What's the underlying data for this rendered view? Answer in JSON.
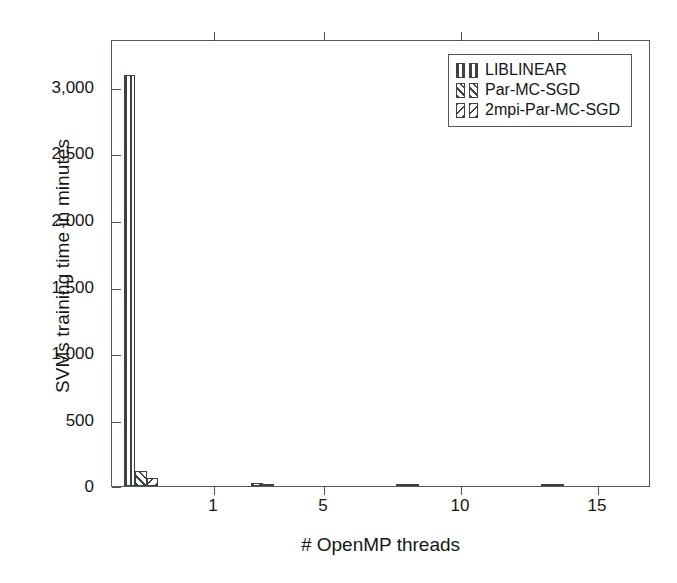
{
  "chart_data": {
    "type": "bar",
    "title": "",
    "xlabel": "# OpenMP threads",
    "ylabel": "SVMs training time in minutes",
    "categories": [
      "1",
      "5",
      "10",
      "15"
    ],
    "x": [
      1,
      5,
      10,
      15
    ],
    "xlim": [
      0,
      18.5
    ],
    "ylim": [
      0,
      3350
    ],
    "yticks": [
      0,
      500,
      1000,
      1500,
      2000,
      2500,
      3000
    ],
    "ytick_labels": [
      "0",
      "500",
      "1,000",
      "1,500",
      "2,000",
      "2,500",
      "3,000"
    ],
    "xticks": [
      1,
      5,
      10,
      15
    ],
    "xtick_labels": [
      "1",
      "5",
      "10",
      "15"
    ],
    "grid": false,
    "legend_position": "top-right",
    "series": [
      {
        "name": "LIBLINEAR",
        "pattern": "vertical-lines",
        "values": [
          3100,
          0,
          0,
          0
        ]
      },
      {
        "name": "Par-MC-SGD",
        "pattern": "forward-diagonal-hatch",
        "values": [
          110,
          25,
          16,
          11
        ]
      },
      {
        "name": "2mpi-Par-MC-SGD",
        "pattern": "backward-diagonal-hatch",
        "values": [
          58,
          14,
          9,
          7
        ]
      }
    ]
  },
  "legend": {
    "entries": [
      {
        "label": "LIBLINEAR"
      },
      {
        "label": "Par-MC-SGD"
      },
      {
        "label": "2mpi-Par-MC-SGD"
      }
    ]
  },
  "axes": {
    "y_title": "SVMs training time in minutes",
    "x_title": "# OpenMP threads"
  }
}
